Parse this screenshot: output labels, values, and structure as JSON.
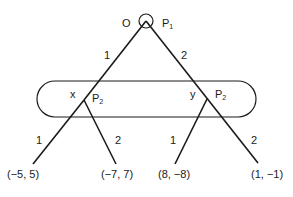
{
  "diagram": {
    "type": "extensive-form game tree",
    "root": {
      "node_label": "O",
      "player": "P",
      "player_sub": "1"
    },
    "root_edges": [
      {
        "label": "1"
      },
      {
        "label": "2"
      }
    ],
    "information_set": {
      "player": "P",
      "player_sub": "2",
      "nodes": [
        {
          "node_label": "x",
          "player": "P",
          "player_sub": "2"
        },
        {
          "node_label": "y",
          "player": "P",
          "player_sub": "2"
        }
      ]
    },
    "second_level_edges": [
      {
        "label": "1"
      },
      {
        "label": "2"
      },
      {
        "label": "1"
      },
      {
        "label": "2"
      }
    ],
    "payoffs": [
      {
        "text": "(−5, 5)"
      },
      {
        "text": "(−7, 7)"
      },
      {
        "text": "(8, −8)"
      },
      {
        "text": "(1, −1)"
      }
    ]
  }
}
